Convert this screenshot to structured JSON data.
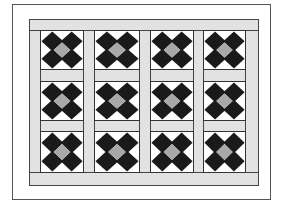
{
  "diagram": {
    "type": "quilt-layout",
    "grid": {
      "rows": 3,
      "columns": 4
    },
    "colors": {
      "background": "#ffffff",
      "sashing": "#e2e2e2",
      "dark_patch": "#1a1a1a",
      "center_patch": "#a8a8a8",
      "block_background": "#ffffff",
      "outline": "#333333"
    },
    "block_pattern": {
      "name": "nine-patch-diamond",
      "corner_diamonds": 4,
      "center_diamond": 1
    }
  }
}
